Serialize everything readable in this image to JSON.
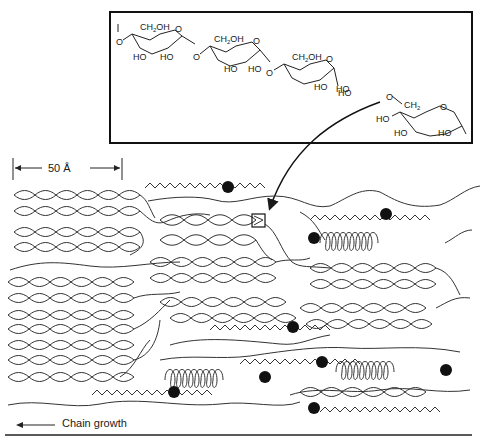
{
  "figure": {
    "inset": {
      "description": "Glucose chain showing branch point",
      "ring_labels": {
        "ch2oh": "CH2OH",
        "ch2": "CH2",
        "ho": "HO",
        "o": "O"
      }
    },
    "scale_bar": {
      "label": "50 Å",
      "length_px": 110
    },
    "direction_arrow": {
      "label": "Chain growth"
    },
    "legend_symbols": {
      "double_helix": "double-helical chain segment",
      "single_helix": "single helix (V-amylose)",
      "zigzag": "extended chain",
      "dot": "reducing end",
      "box": "branch point (enlarged in inset)"
    },
    "colors": {
      "line": "#1a1a1a",
      "background": "#ffffff"
    }
  }
}
